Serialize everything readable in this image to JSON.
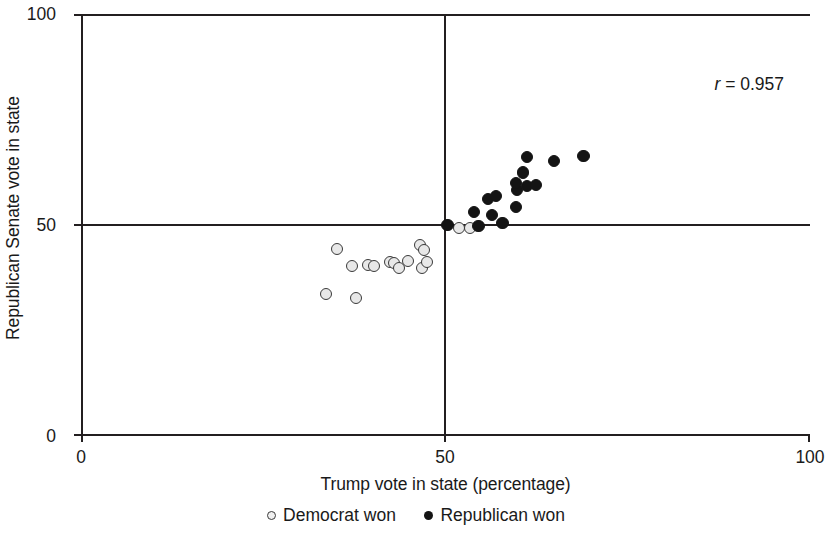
{
  "chart_data": {
    "type": "scatter",
    "title": "",
    "xlabel": "Trump vote in state (percentage)",
    "ylabel": "Republican Senate vote in state",
    "xlim": [
      0,
      100
    ],
    "ylim": [
      0,
      100
    ],
    "xticks": [
      0,
      50,
      100
    ],
    "yticks": [
      0,
      50,
      100
    ],
    "xtick_labels": [
      "0",
      "50",
      "100"
    ],
    "ytick_labels": [
      "0",
      "50",
      "100"
    ],
    "grid": false,
    "reference_lines": [
      {
        "axis": "x",
        "value": 50
      },
      {
        "axis": "y",
        "value": 50
      }
    ],
    "annotations": [
      {
        "text": "r = 0.957",
        "symbol": "r",
        "value": "= 0.957",
        "x": 93,
        "y": 89
      }
    ],
    "legend_position": "bottom",
    "series": [
      {
        "name": "Democrat won",
        "marker": "open-circle",
        "color": "#e8e8e8",
        "edge_color": "#3a3a3a",
        "points": [
          {
            "x": 35.1,
            "y": 44.3
          },
          {
            "x": 37.2,
            "y": 40.3
          },
          {
            "x": 39.4,
            "y": 40.5
          },
          {
            "x": 40.2,
            "y": 40.3
          },
          {
            "x": 33.6,
            "y": 33.6
          },
          {
            "x": 37.7,
            "y": 32.7
          },
          {
            "x": 42.4,
            "y": 41.2
          },
          {
            "x": 43.0,
            "y": 41.0
          },
          {
            "x": 43.6,
            "y": 39.7
          },
          {
            "x": 44.8,
            "y": 41.5
          },
          {
            "x": 46.8,
            "y": 39.8
          },
          {
            "x": 47.5,
            "y": 41.2
          },
          {
            "x": 46.5,
            "y": 45.3
          },
          {
            "x": 47.0,
            "y": 44.0
          },
          {
            "x": 51.9,
            "y": 49.3
          },
          {
            "x": 53.4,
            "y": 49.3
          }
        ]
      },
      {
        "name": "Republican won",
        "marker": "filled-circle",
        "color": "#141414",
        "points": [
          {
            "x": 50.3,
            "y": 50.0
          },
          {
            "x": 53.9,
            "y": 53.1
          },
          {
            "x": 56.4,
            "y": 52.4
          },
          {
            "x": 55.8,
            "y": 56.2
          },
          {
            "x": 56.9,
            "y": 56.9
          },
          {
            "x": 59.7,
            "y": 54.3
          },
          {
            "x": 59.8,
            "y": 58.3
          },
          {
            "x": 59.7,
            "y": 59.9
          },
          {
            "x": 60.6,
            "y": 62.4
          },
          {
            "x": 61.2,
            "y": 59.2
          },
          {
            "x": 62.4,
            "y": 59.5
          },
          {
            "x": 61.2,
            "y": 66.1
          },
          {
            "x": 64.9,
            "y": 65.2
          },
          {
            "x": 68.9,
            "y": 66.4
          },
          {
            "x": 57.8,
            "y": 50.5
          },
          {
            "x": 54.5,
            "y": 49.8
          }
        ]
      }
    ]
  },
  "legend": {
    "items": [
      {
        "label": "Democrat won",
        "marker": "open-circle"
      },
      {
        "label": "Republican won",
        "marker": "filled-circle"
      }
    ]
  }
}
